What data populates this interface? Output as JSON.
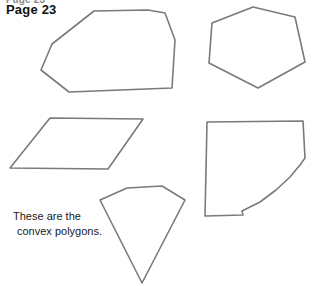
{
  "page": {
    "width": 312,
    "height": 286,
    "background_color": "#ffffff",
    "clipped_header_text": "Page 23",
    "title": "Page 23"
  },
  "caption": {
    "line1": "These are the",
    "line2": "convex polygons."
  },
  "figure": {
    "stroke_color": "#7a7a7a",
    "stroke_width": 1.6,
    "fill_color": "none",
    "shapes": [
      {
        "name": "heptagon-top-left",
        "label": "convex heptagon",
        "points": "94,11 148,10 165,13 175,40 172,88 69,92 41,70 52,44"
      },
      {
        "name": "hexagon-top-right",
        "label": "convex hexagon",
        "points": "253,7 295,17 305,62 258,88 209,63 212,23"
      },
      {
        "name": "parallelogram-middle-left",
        "label": "convex parallelogram",
        "points": "50,118 143,119 108,169 10,168"
      },
      {
        "name": "curved-quadrilateral-middle-right",
        "label": "convex polygon with rounded edge",
        "points": "207,122 303,121 305,158 300,165 290,177 276,190 260,202 242,211 243,215 205,216"
      },
      {
        "name": "kite-pentagon-bottom-center",
        "label": "convex kite pentagon",
        "points": "127,188 162,186 185,200 142,283 100,200"
      }
    ]
  }
}
